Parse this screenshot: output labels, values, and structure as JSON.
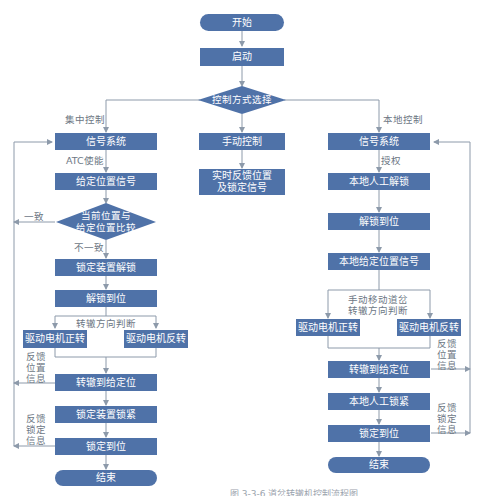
{
  "title": "道岔转辙机控制流程图",
  "accent_color": "#4f72a8",
  "line_color": "#8d9aaa",
  "top": {
    "start": "开始",
    "launch": "启动",
    "choice": "控制方式选择"
  },
  "branch_labels": {
    "central": "集中控制",
    "local": "本地控制"
  },
  "central": {
    "signal_system": "信号系统",
    "atc_enable": "ATC使能",
    "set_position_signal": "给定位置信号",
    "compare": "当前位置与给定位置比较",
    "compare_line1": "当前位置与",
    "compare_line2": "给定位置比较",
    "consistent": "一致",
    "inconsistent": "不一致",
    "unlock_device": "锁定装置解锁",
    "unlock_done": "解锁到位",
    "direction_judge": "转辙方向判断",
    "motor_forward": "驱动电机正转",
    "motor_reverse": "驱动电机反转",
    "feedback_position": "反馈位置信息",
    "switch_to_position": "转辙到给定位",
    "lock_device": "锁定装置锁紧",
    "feedback_lock": "反馈锁定信息",
    "lock_done": "锁定到位",
    "end": "结束"
  },
  "manual": {
    "manual_control": "手动控制",
    "realtime_feedback_line1": "实时反馈位置",
    "realtime_feedback_line2": "及锁定信号"
  },
  "local": {
    "signal_system": "信号系统",
    "authorize": "授权",
    "local_manual_unlock": "本地人工解锁",
    "unlock_done": "解锁到位",
    "local_set_position_signal": "本地给定位置信号",
    "manual_move_line1": "手动移动道岔",
    "manual_move_line2": "转辙方向判断",
    "motor_forward": "驱动电机正转",
    "motor_reverse": "驱动电机反转",
    "feedback_position": "反馈位置信息",
    "switch_to_position": "转辙到给定位",
    "local_manual_lock": "本地人工锁紧",
    "feedback_lock": "反馈锁定信息",
    "lock_done": "锁定到位",
    "end": "结束"
  },
  "feedback_chars": {
    "pos": [
      "反馈",
      "位置",
      "信息"
    ],
    "lock": [
      "反馈",
      "锁定",
      "信息"
    ]
  },
  "caption": "图 3-3-6  道岔转辙机控制流程图"
}
